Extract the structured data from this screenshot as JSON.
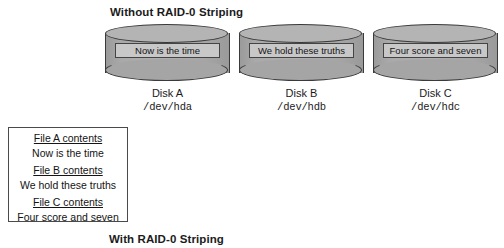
{
  "figure": {
    "top_title": "Without RAID-0 Striping",
    "bottom_title": "With RAID-0 Striping"
  },
  "disks": [
    {
      "id": "disk-a",
      "chunk_text": "Now is the time",
      "name": "Disk A",
      "device": "/dev/hda"
    },
    {
      "id": "disk-b",
      "chunk_text": "We hold these truths",
      "name": "Disk B",
      "device": "/dev/hdb"
    },
    {
      "id": "disk-c",
      "chunk_text": "Four score and seven",
      "name": "Disk C",
      "device": "/dev/hdc"
    }
  ],
  "legend": {
    "entries": [
      {
        "heading": "File A contents",
        "value": "Now is the time"
      },
      {
        "heading": "File B contents",
        "value": "We hold these truths"
      },
      {
        "heading": "File C contents",
        "value": "Four score and seven"
      }
    ]
  },
  "colors": {
    "disk_body": "#a9a9a9",
    "disk_top": "#b4b4b4",
    "disk_outline": "#3a3a3a",
    "chunk_fill": "#c8c8c8",
    "text": "#1b1b1b",
    "background": "#ffffff"
  }
}
